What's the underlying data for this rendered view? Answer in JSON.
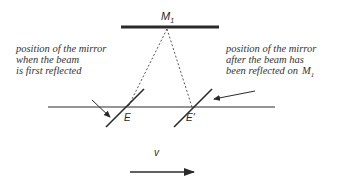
{
  "diagram": {
    "top_mirror": {
      "label": "M",
      "subscript": "1"
    },
    "left_caption": {
      "lines": [
        "position of the mirror",
        "when the beam",
        "is first reflected"
      ]
    },
    "right_caption": {
      "lines": [
        "position of the mirror",
        "after the beam has",
        "been reflected on"
      ],
      "ref_label": "M",
      "ref_subscript": "1"
    },
    "mirror_positions": {
      "first": "E",
      "second": "E'"
    },
    "velocity": {
      "label": "v"
    },
    "colors": {
      "line": "#2a2a2a",
      "text": "#333333",
      "background": "#ffffff"
    }
  }
}
